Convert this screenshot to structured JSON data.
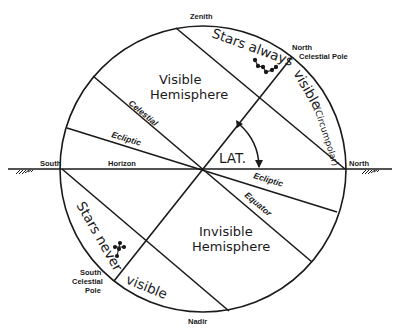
{
  "diagram": {
    "labels": {
      "zenith": "Zenith",
      "nadir": "Nadir",
      "south": "South",
      "north": "North",
      "horizon": "Horizon",
      "ncp_line1": "North",
      "ncp_line2": "Celestial Pole",
      "scp_line1": "South",
      "scp_line2": "Celestial",
      "scp_line3": "Pole",
      "celestial": "Celestial",
      "ecliptic_upper": "Ecliptic",
      "ecliptic_lower": "Ecliptic",
      "equator": "Equator",
      "visible_hemisphere_1": "Visible",
      "visible_hemisphere_2": "Hemisphere",
      "invisible_hemisphere_1": "Invisible",
      "invisible_hemisphere_2": "Hemisphere",
      "stars_always": "Stars always",
      "visible_circumpolar": "visible",
      "circumpolar": "(Circumpolar)",
      "stars_never": "Stars never",
      "never_visible": "visible",
      "latitude": "LAT."
    }
  }
}
